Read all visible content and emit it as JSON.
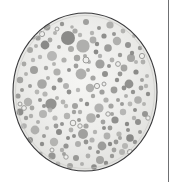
{
  "figure": {
    "kind": "petri-dish-micrograph",
    "title": "Agar plate with bacterial colonies",
    "background_color": "#ffffff",
    "width": 179,
    "height": 182
  },
  "column_rule": {
    "name": "vertical-page-rule",
    "color": "#6f7073",
    "x": 168,
    "width": 1.4,
    "top": 0,
    "height": 182
  },
  "dish": {
    "label": "Petri dish",
    "center_x": 85,
    "center_y": 92,
    "radius_x": 72,
    "radius_y": 79,
    "agar_color": "#e9e9e7",
    "agar_highlight_color": "#f4f4f2",
    "rim_color": "#3a3a3c",
    "rim_width": 1.1,
    "inner_ring_color": "#c9c9c6"
  },
  "colonies": {
    "legend": "Gray circular colonies of varying diameter; some are rings with pale centers",
    "solid_color": "#9b9b99",
    "solid_color_dark": "#8a8a88",
    "solid_color_light": "#adadab",
    "ring_stroke_color": "#9b9b99",
    "ring_fill_color": "#eeeeec",
    "total_count": 196,
    "solid_count": 176,
    "ring_count": 20,
    "solid": [
      [
        47,
        27,
        3.4
      ],
      [
        62,
        24,
        2.2
      ],
      [
        75,
        31,
        2.6
      ],
      [
        86,
        22,
        3.0
      ],
      [
        99,
        28,
        2.0
      ],
      [
        110,
        25,
        3.6
      ],
      [
        123,
        31,
        2.4
      ],
      [
        134,
        36,
        2.0
      ],
      [
        55,
        33,
        2.0
      ],
      [
        68,
        38,
        7.0
      ],
      [
        80,
        35,
        2.2
      ],
      [
        93,
        40,
        3.4
      ],
      [
        104,
        36,
        2.6
      ],
      [
        117,
        41,
        4.2
      ],
      [
        128,
        45,
        3.0
      ],
      [
        140,
        48,
        2.2
      ],
      [
        38,
        38,
        2.6
      ],
      [
        45,
        45,
        4.4
      ],
      [
        59,
        47,
        2.0
      ],
      [
        71,
        49,
        3.0
      ],
      [
        83,
        46,
        6.6
      ],
      [
        96,
        52,
        2.4
      ],
      [
        108,
        48,
        3.8
      ],
      [
        120,
        55,
        2.2
      ],
      [
        131,
        58,
        4.0
      ],
      [
        143,
        62,
        2.4
      ],
      [
        30,
        50,
        3.0
      ],
      [
        40,
        57,
        2.2
      ],
      [
        52,
        56,
        5.0
      ],
      [
        64,
        60,
        2.6
      ],
      [
        77,
        58,
        3.2
      ],
      [
        89,
        62,
        2.0
      ],
      [
        100,
        64,
        4.6
      ],
      [
        112,
        60,
        2.4
      ],
      [
        124,
        68,
        3.4
      ],
      [
        136,
        72,
        2.6
      ],
      [
        147,
        76,
        2.0
      ],
      [
        24,
        64,
        2.4
      ],
      [
        34,
        70,
        4.0
      ],
      [
        46,
        68,
        2.2
      ],
      [
        57,
        72,
        3.6
      ],
      [
        69,
        70,
        2.0
      ],
      [
        81,
        74,
        5.4
      ],
      [
        93,
        78,
        2.6
      ],
      [
        105,
        74,
        3.0
      ],
      [
        117,
        80,
        2.2
      ],
      [
        129,
        84,
        4.4
      ],
      [
        141,
        88,
        2.4
      ],
      [
        20,
        80,
        3.2
      ],
      [
        30,
        86,
        2.0
      ],
      [
        42,
        84,
        4.8
      ],
      [
        54,
        88,
        2.4
      ],
      [
        66,
        86,
        3.0
      ],
      [
        78,
        90,
        2.2
      ],
      [
        90,
        88,
        4.2
      ],
      [
        102,
        92,
        2.6
      ],
      [
        114,
        90,
        3.4
      ],
      [
        126,
        96,
        2.0
      ],
      [
        138,
        100,
        3.8
      ],
      [
        148,
        94,
        2.2
      ],
      [
        18,
        96,
        2.6
      ],
      [
        28,
        102,
        4.2
      ],
      [
        40,
        100,
        2.0
      ],
      [
        51,
        104,
        5.6
      ],
      [
        63,
        102,
        2.4
      ],
      [
        75,
        106,
        3.0
      ],
      [
        87,
        104,
        2.2
      ],
      [
        99,
        108,
        4.6
      ],
      [
        111,
        106,
        2.6
      ],
      [
        123,
        112,
        3.2
      ],
      [
        135,
        110,
        2.0
      ],
      [
        145,
        114,
        3.0
      ],
      [
        20,
        112,
        3.4
      ],
      [
        31,
        116,
        2.2
      ],
      [
        43,
        114,
        4.0
      ],
      [
        55,
        118,
        2.6
      ],
      [
        67,
        116,
        3.2
      ],
      [
        79,
        120,
        2.0
      ],
      [
        91,
        118,
        4.8
      ],
      [
        103,
        122,
        2.4
      ],
      [
        115,
        120,
        3.6
      ],
      [
        127,
        124,
        2.2
      ],
      [
        138,
        122,
        3.0
      ],
      [
        24,
        126,
        2.8
      ],
      [
        35,
        130,
        4.4
      ],
      [
        47,
        128,
        2.0
      ],
      [
        59,
        132,
        3.0
      ],
      [
        71,
        130,
        2.4
      ],
      [
        83,
        134,
        5.0
      ],
      [
        95,
        132,
        2.2
      ],
      [
        107,
        136,
        3.4
      ],
      [
        119,
        134,
        2.6
      ],
      [
        130,
        138,
        3.8
      ],
      [
        140,
        132,
        2.0
      ],
      [
        30,
        140,
        3.0
      ],
      [
        42,
        144,
        2.2
      ],
      [
        54,
        142,
        4.2
      ],
      [
        66,
        146,
        2.6
      ],
      [
        78,
        144,
        3.0
      ],
      [
        90,
        148,
        2.0
      ],
      [
        102,
        146,
        4.4
      ],
      [
        114,
        150,
        2.4
      ],
      [
        125,
        146,
        3.0
      ],
      [
        135,
        142,
        2.2
      ],
      [
        40,
        154,
        2.6
      ],
      [
        52,
        156,
        3.6
      ],
      [
        64,
        154,
        2.0
      ],
      [
        76,
        158,
        3.0
      ],
      [
        88,
        156,
        2.4
      ],
      [
        100,
        160,
        4.0
      ],
      [
        112,
        156,
        2.2
      ],
      [
        122,
        152,
        3.0
      ],
      [
        58,
        164,
        2.4
      ],
      [
        70,
        166,
        3.0
      ],
      [
        82,
        164,
        2.0
      ],
      [
        94,
        167,
        2.8
      ],
      [
        106,
        163,
        2.2
      ],
      [
        36,
        46,
        2.0
      ],
      [
        50,
        40,
        2.4
      ],
      [
        72,
        27,
        1.8
      ],
      [
        92,
        33,
        2.2
      ],
      [
        114,
        34,
        2.0
      ],
      [
        132,
        53,
        2.2
      ],
      [
        26,
        74,
        2.0
      ],
      [
        37,
        92,
        2.4
      ],
      [
        48,
        78,
        2.0
      ],
      [
        60,
        80,
        2.6
      ],
      [
        85,
        56,
        2.0
      ],
      [
        97,
        44,
        2.2
      ],
      [
        109,
        66,
        2.0
      ],
      [
        120,
        74,
        2.4
      ],
      [
        133,
        92,
        2.2
      ],
      [
        144,
        104,
        2.0
      ],
      [
        22,
        90,
        2.0
      ],
      [
        33,
        60,
        2.2
      ],
      [
        45,
        94,
        2.6
      ],
      [
        57,
        98,
        2.0
      ],
      [
        69,
        92,
        2.4
      ],
      [
        81,
        100,
        2.0
      ],
      [
        93,
        96,
        2.2
      ],
      [
        106,
        100,
        2.6
      ],
      [
        118,
        100,
        2.0
      ],
      [
        130,
        104,
        2.4
      ],
      [
        142,
        80,
        2.0
      ],
      [
        26,
        118,
        2.2
      ],
      [
        38,
        122,
        2.0
      ],
      [
        50,
        110,
        2.4
      ],
      [
        62,
        124,
        2.0
      ],
      [
        74,
        112,
        2.2
      ],
      [
        86,
        126,
        2.6
      ],
      [
        98,
        116,
        2.0
      ],
      [
        110,
        128,
        2.4
      ],
      [
        122,
        104,
        2.0
      ],
      [
        134,
        118,
        2.2
      ],
      [
        44,
        136,
        2.0
      ],
      [
        56,
        126,
        2.4
      ],
      [
        68,
        138,
        2.0
      ],
      [
        80,
        112,
        2.2
      ],
      [
        92,
        140,
        2.6
      ],
      [
        104,
        128,
        2.0
      ],
      [
        116,
        142,
        2.4
      ],
      [
        128,
        130,
        2.0
      ],
      [
        62,
        150,
        2.2
      ],
      [
        74,
        136,
        2.0
      ],
      [
        86,
        142,
        2.4
      ],
      [
        98,
        152,
        2.0
      ],
      [
        110,
        144,
        2.2
      ],
      [
        120,
        138,
        2.0
      ],
      [
        66,
        106,
        2.2
      ],
      [
        54,
        64,
        2.0
      ],
      [
        76,
        66,
        2.4
      ],
      [
        88,
        70,
        2.0
      ],
      [
        100,
        56,
        2.2
      ],
      [
        112,
        114,
        2.0
      ],
      [
        124,
        88,
        2.4
      ],
      [
        136,
        62,
        2.0
      ],
      [
        146,
        86,
        2.2
      ],
      [
        44,
        106,
        2.0
      ],
      [
        32,
        108,
        2.4
      ]
    ],
    "rings": [
      [
        35,
        31,
        3.2
      ],
      [
        42,
        34,
        2.6
      ],
      [
        39,
        26,
        2.2
      ],
      [
        33,
        37,
        2.0
      ],
      [
        57,
        29,
        2.0
      ],
      [
        86,
        60,
        3.0
      ],
      [
        97,
        86,
        2.6
      ],
      [
        104,
        84,
        2.0
      ],
      [
        73,
        123,
        2.8
      ],
      [
        80,
        126,
        2.2
      ],
      [
        142,
        56,
        2.6
      ],
      [
        130,
        152,
        2.6
      ],
      [
        63,
        170,
        2.4
      ],
      [
        24,
        108,
        2.4
      ],
      [
        20,
        104,
        2.0
      ],
      [
        118,
        64,
        2.4
      ],
      [
        148,
        118,
        2.2
      ],
      [
        66,
        157,
        2.2
      ],
      [
        52,
        150,
        2.0
      ],
      [
        108,
        114,
        2.2
      ]
    ]
  }
}
